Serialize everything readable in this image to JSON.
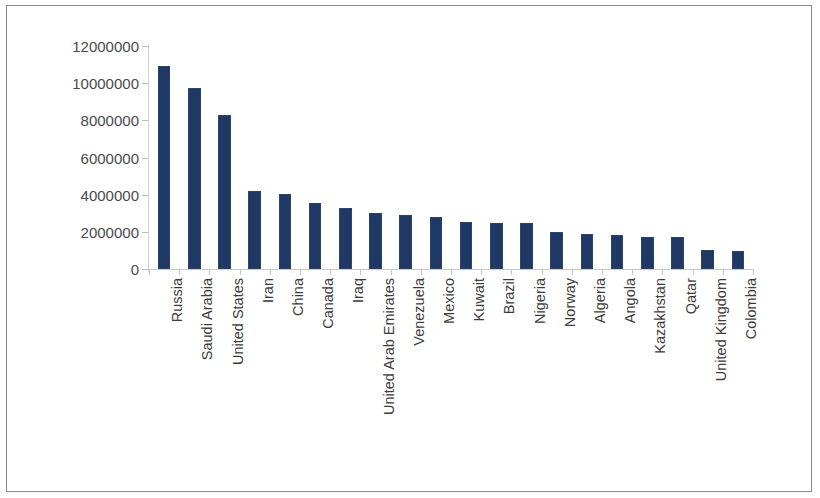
{
  "chart_data": {
    "type": "bar",
    "title": "",
    "subtitle": "",
    "xlabel": "",
    "ylabel": "",
    "ylim": [
      0,
      12000000
    ],
    "ytick_values": [
      0,
      2000000,
      4000000,
      6000000,
      8000000,
      10000000,
      12000000
    ],
    "ytick_labels": [
      "0",
      "2000000",
      "4000000",
      "6000000",
      "8000000",
      "10000000",
      "12000000"
    ],
    "grid": false,
    "legend": false,
    "legend_position": "none",
    "bar_color": "#1f3864",
    "axis_color": "#c8c8c8",
    "tick_label_color": "#4a4a4a",
    "categories": [
      "Russia",
      "Saudi Arabia",
      "United States",
      "Iran",
      "China",
      "Canada",
      "Iraq",
      "United Arab Emirates",
      "Venezuela",
      "Mexico",
      "Kuwait",
      "Brazil",
      "Nigeria",
      "Norway",
      "Algeria",
      "Angola",
      "Kazakhstan",
      "Qatar",
      "United Kingdom",
      "Colombia"
    ],
    "values": [
      10900000,
      9750000,
      8300000,
      4200000,
      4050000,
      3550000,
      3300000,
      3000000,
      2900000,
      2800000,
      2550000,
      2500000,
      2500000,
      2000000,
      1900000,
      1850000,
      1700000,
      1700000,
      1050000,
      950000
    ]
  }
}
